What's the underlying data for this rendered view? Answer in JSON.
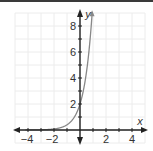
{
  "chart_data": {
    "type": "line",
    "title": "",
    "xlabel": "x",
    "ylabel": "y",
    "xlim": [
      -5,
      5
    ],
    "ylim": [
      -1,
      9
    ],
    "grid": true,
    "x_ticks": [
      -4,
      -2,
      2,
      4
    ],
    "y_ticks": [
      2,
      4,
      6,
      8
    ],
    "x_tick_labels": [
      "−4",
      "−2",
      "2",
      "4"
    ],
    "y_tick_labels": [
      "2",
      "4",
      "6",
      "8"
    ],
    "series": [
      {
        "name": "y = 2·5^x",
        "function": "2*5^x",
        "color": "#888888",
        "x": [
          -4,
          -3,
          -2,
          -1.5,
          -1,
          -0.5,
          0,
          0.25,
          0.5,
          0.75,
          1.0,
          1.1
        ],
        "y": [
          0.003,
          0.016,
          0.08,
          0.18,
          0.4,
          0.89,
          2,
          2.99,
          4.47,
          6.69,
          10,
          11.7
        ]
      }
    ],
    "axis_color": "#222222",
    "grid_color": "#ececec",
    "curve_color": "#888888"
  }
}
